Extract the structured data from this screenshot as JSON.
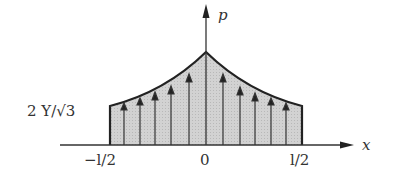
{
  "diagram": {
    "type": "pressure-distribution",
    "axes": {
      "x_label": "x",
      "y_label": "p"
    },
    "ticks": {
      "left": "−l/2",
      "center": "0",
      "right": "l/2"
    },
    "edge_value_label": "2 Y/√3",
    "colors": {
      "fill": "#cfcfcf",
      "stroke": "#222222",
      "text": "#333333"
    },
    "arrow_count_per_side": 5
  }
}
